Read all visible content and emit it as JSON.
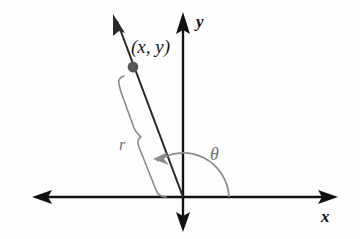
{
  "figure": {
    "type": "polar-coordinate-diagram",
    "background_color": "#fefefe",
    "width": 360,
    "height": 239
  },
  "labels": {
    "x_axis": "x",
    "y_axis": "y",
    "point": "(x, y)",
    "radius": "r",
    "angle": "θ"
  },
  "colors": {
    "axis": "#111111",
    "ray": "#2a2a2a",
    "point_dot": "#555555",
    "annotation": "#8a8a8a",
    "label_dark": "#1a1a1a",
    "label_gray": "#6d6d6d"
  },
  "geometry": {
    "origin": {
      "x": 183,
      "y": 197
    },
    "x_axis": {
      "left_tip": 32,
      "right_tip": 338,
      "y": 197
    },
    "y_axis": {
      "top_tip": 12,
      "bottom_tip": 232,
      "x": 183
    },
    "ray": {
      "tip_x": 113,
      "tip_y": 14
    },
    "point_dot": {
      "x": 133,
      "y": 67,
      "radius": 5
    },
    "angle_arc": {
      "radius": 46,
      "start_deg": 0,
      "end_deg": 124
    },
    "brace": {
      "top_x": 122,
      "top_y": 80,
      "bottom_x": 166,
      "bottom_y": 197,
      "notch_x": 140,
      "notch_y": 138
    }
  }
}
